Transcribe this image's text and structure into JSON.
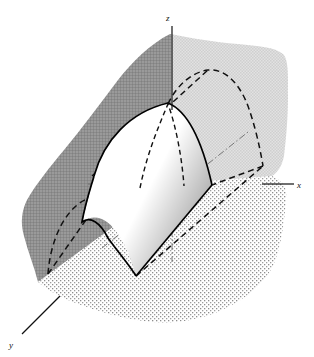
{
  "figure": {
    "background_color": "#ffffff",
    "width": 314,
    "height": 357
  },
  "axes": {
    "x": {
      "label": "x",
      "label_x": 299,
      "label_y": 187,
      "tip_x": 293,
      "tip_y": 184,
      "origin_x": 172,
      "origin_y": 184
    },
    "y": {
      "label": "y",
      "label_x": 13,
      "label_y": 344,
      "tip_x": 20,
      "tip_y": 336,
      "origin_x": 172,
      "origin_y": 184
    },
    "z": {
      "label": "z",
      "label_x": 166,
      "label_y": 19,
      "tip_x": 168,
      "tip_y": 24,
      "origin_x": 172,
      "origin_y": 184
    },
    "axis_color": "#111111",
    "hidden_axis_style": "dash-dot"
  },
  "planes": [
    {
      "name": "vertical-back-plane-dark",
      "fill": "#8f8f8f",
      "texture": "fine-crosshatch",
      "opacity": 1
    },
    {
      "name": "vertical-back-plane-light",
      "fill": "#d9d9d9",
      "texture": "fine-checker",
      "opacity": 1
    },
    {
      "name": "horizontal-ground-plane",
      "fill": "#f2f2f2",
      "texture": "stipple-dots",
      "opacity": 1
    }
  ],
  "surface": {
    "name": "parabolic-cylinder",
    "fill": "#ffffff",
    "shading": "pen-hatch-gradient",
    "outline_color": "#000000",
    "apex_x": 168,
    "apex_y": 103
  },
  "curves": [
    {
      "name": "front-parabola-solid",
      "style": "solid"
    },
    {
      "name": "back-parabola-dashed",
      "style": "dashed"
    },
    {
      "name": "lower-left-parabola-dashed",
      "style": "dashed"
    },
    {
      "name": "generator-line-dashed",
      "style": "dashed"
    },
    {
      "name": "centre-parabola-dashed",
      "style": "dashed"
    }
  ],
  "colors": {
    "ink": "#000000",
    "dark_plane": "#8f8f8f",
    "light_plane": "#d9d9d9",
    "ground_plane": "#f2f2f2",
    "paper": "#ffffff"
  }
}
